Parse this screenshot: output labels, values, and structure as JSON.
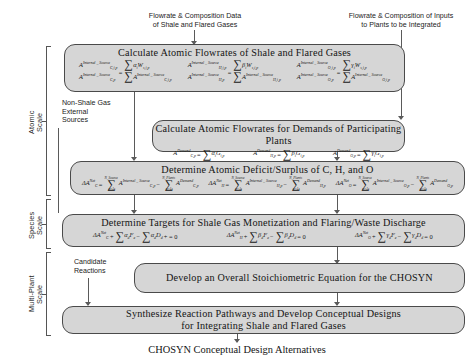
{
  "figure": {
    "caption": "CHOSYN Conceptual Design Alternatives"
  },
  "annotations": {
    "input_shale": "Flowrate & Composition Data\nof Shale and Flared Gases",
    "input_plants": "Flowrate & Composition of Inputs\nto Plants to be Integrated",
    "non_shale": "Non-Shale Gas\nExternal\nSources",
    "candidate_reactions": "Candidate\nReactions"
  },
  "scales": [
    {
      "label": "Atomic\nScale"
    },
    {
      "label": "Species\nScale"
    },
    {
      "label": "Multi-Plant\nScale"
    }
  ],
  "boxes": [
    {
      "id": "calc-shale-flared",
      "title": "Calculate Atomic Flowrates of Shale and Flared Gases",
      "equations": [
        {
          "top_lhs": "A",
          "top_lhs_sup": "Internal _ Source",
          "top_lhs_sub": "C,i,p",
          "top_rhs_coef": "α",
          "top_rhs_coef_sub": "i",
          "top_rhs_var": "W",
          "top_rhs_var_sub": "s,i,p",
          "bot_lhs": "A",
          "bot_lhs_sup": "Internal _ Source",
          "bot_lhs_sub": "C,p",
          "bot_rhs": "A",
          "bot_rhs_sup": "Internal _ Source",
          "bot_rhs_sub": "C,i,p"
        },
        {
          "top_lhs": "A",
          "top_lhs_sup": "Internal _ Source",
          "top_lhs_sub": "H,i,p",
          "top_rhs_coef": "β",
          "top_rhs_coef_sub": "i",
          "top_rhs_var": "W",
          "top_rhs_var_sub": "s,i,p",
          "bot_lhs": "A",
          "bot_lhs_sup": "Internal _ Source",
          "bot_lhs_sub": "H,p",
          "bot_rhs": "A",
          "bot_rhs_sup": "Internal _ Source",
          "bot_rhs_sub": "H,i,p"
        },
        {
          "top_lhs": "A",
          "top_lhs_sup": "Internal _ Source",
          "top_lhs_sub": "O,i,p",
          "top_rhs_coef": "γ",
          "top_rhs_coef_sub": "i",
          "top_rhs_var": "W",
          "top_rhs_var_sub": "s,i,p",
          "bot_lhs": "A",
          "bot_lhs_sup": "Internal _ Source",
          "bot_lhs_sub": "O,p",
          "bot_rhs": "A",
          "bot_rhs_sup": "Internal _ Source",
          "bot_rhs_sub": "O,i,p"
        }
      ]
    },
    {
      "id": "calc-demands",
      "title": "Calculate Atomic Flowrates for Demands of Participating Plants",
      "equations": [
        {
          "lhs": "A",
          "lhs_sup": "Demand",
          "lhs_sub": "C,p",
          "coef": "α",
          "coef_sub": "i",
          "var": "G",
          "var_sub": "i,p"
        },
        {
          "lhs": "A",
          "lhs_sup": "Demand",
          "lhs_sub": "H,p",
          "coef": "β",
          "coef_sub": "i",
          "var": "G",
          "var_sub": "i,p"
        },
        {
          "lhs": "A",
          "lhs_sup": "Demand",
          "lhs_sub": "O,p",
          "coef": "γ",
          "coef_sub": "i",
          "var": "G",
          "var_sub": "i,p"
        }
      ]
    },
    {
      "id": "determine-deficit",
      "title": "Determine Atomic Deficit/Surplus of C, H, and O",
      "equations": [
        {
          "lhs": "ΔA",
          "lhs_sup": "Net",
          "lhs_sub": "C",
          "sum1_top": "N_Source",
          "sum1_bot": "p=1",
          "t1": "A",
          "t1_sup": "Internal _ Source",
          "t1_sub": "C,p",
          "sum2_top": "N_Plants",
          "sum2_bot": "p=1",
          "t2": "A",
          "t2_sup": "Demand",
          "t2_sub": "C,p"
        },
        {
          "lhs": "ΔA",
          "lhs_sup": "Net",
          "lhs_sub": "H",
          "sum1_top": "N_Source",
          "sum1_bot": "p=1",
          "t1": "A",
          "t1_sup": "Internal _ Source",
          "t1_sub": "H,p",
          "sum2_top": "N_Plants",
          "sum2_bot": "p=1",
          "t2": "A",
          "t2_sup": "Demand",
          "t2_sub": "H,p"
        },
        {
          "lhs": "ΔA",
          "lhs_sup": "Net",
          "lhs_sub": "O",
          "sum1_top": "N_Source",
          "sum1_bot": "p=1",
          "t1": "A",
          "t1_sup": "Internal _ Source",
          "t1_sub": "O,p",
          "sum2_top": "N_Plants",
          "sum2_bot": "p=1",
          "t2": "A",
          "t2_sup": "Demand",
          "t2_sub": "O,p"
        }
      ]
    },
    {
      "id": "determine-targets",
      "title": "Determine Targets for Shale Gas Monetization and Flaring/Waste Discharge",
      "equations": [
        {
          "lhs": "ΔA",
          "lhs_sup": "Net",
          "lhs_sub": "C",
          "c1": "α",
          "c1_sub": "d",
          "v1": "F",
          "v1_sub": "e",
          "c2": "α",
          "c2_sub": "d",
          "v2": "D",
          "v2_sub": "d",
          "tail": "+ = 0"
        },
        {
          "lhs": "ΔA",
          "lhs_sup": "Net",
          "lhs_sub": "H",
          "c1": "β",
          "c1_sub": "d",
          "v1": "F",
          "v1_sub": "e",
          "c2": "β",
          "c2_sub": "d",
          "v2": "D",
          "v2_sub": "d",
          "tail": "= 0"
        },
        {
          "lhs": "ΔA",
          "lhs_sup": "Net",
          "lhs_sub": "O",
          "c1": "γ",
          "c1_sub": "d",
          "v1": "F",
          "v1_sub": "e",
          "c2": "γ",
          "c2_sub": "d",
          "v2": "D",
          "v2_sub": "d",
          "tail": "= 0"
        }
      ]
    },
    {
      "id": "develop-stoichiometric",
      "title": "Develop an Overall Stoichiometric Equation for the CHOSYN",
      "equations": []
    },
    {
      "id": "synthesize-pathways",
      "title": "Synthesize Reaction Pathways and Develop Conceptual Designs\nfor Integrating Shale and Flared Gases",
      "equations": []
    }
  ],
  "colors": {
    "box_fill": "#d6d6d6",
    "box_stroke": "#4a4a4a",
    "connector": "#5a5a5a",
    "text": "#141414",
    "background": "#ffffff"
  }
}
